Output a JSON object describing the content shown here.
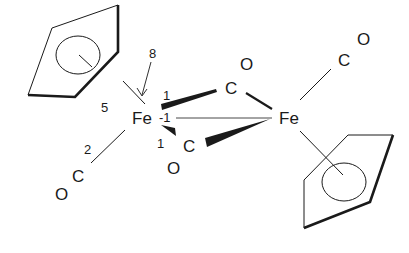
{
  "diagram": {
    "type": "chemical-structure",
    "atoms": {
      "fe_left": "Fe",
      "fe_right": "Fe",
      "c_bridge_top": "C",
      "o_bridge_top": "O",
      "c_bridge_bottom": "C",
      "o_bridge_bottom": "O",
      "c_terminal_left": "C",
      "o_terminal_left": "O",
      "c_terminal_right": "C",
      "o_terminal_right": "O"
    },
    "annotations": {
      "n8": "8",
      "n5": "5",
      "n1_top": "1",
      "n_minus1": "-1",
      "n1_bottom": "1",
      "n2": "2"
    },
    "colors": {
      "line": "#1a1a1a",
      "background": "#ffffff"
    }
  }
}
